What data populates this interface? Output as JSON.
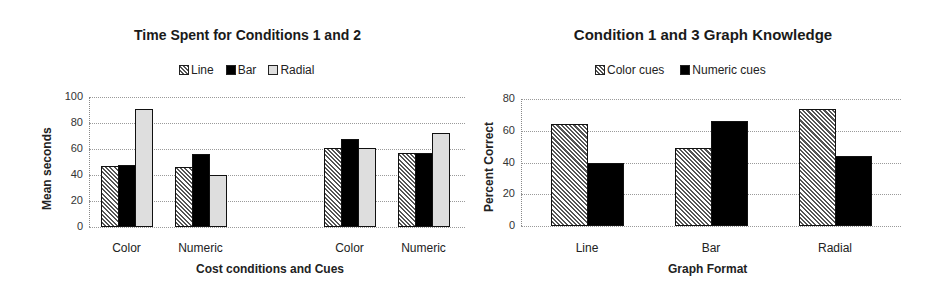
{
  "chart_data": [
    {
      "type": "bar",
      "title": "Time Spent for Conditions 1 and 2",
      "xlabel": "Cost conditions and Cues",
      "ylabel": "Mean seconds",
      "ylim": [
        0,
        100
      ],
      "yticks": [
        0,
        20,
        40,
        60,
        80,
        100
      ],
      "grid": true,
      "legend_position": "top",
      "categories": [
        "Color",
        "Numeric",
        "Color",
        "Numeric"
      ],
      "series": [
        {
          "name": "Line",
          "pattern": "hatch",
          "values": [
            47,
            46,
            61,
            57
          ]
        },
        {
          "name": "Bar",
          "pattern": "black",
          "values": [
            48,
            56,
            68,
            57
          ]
        },
        {
          "name": "Radial",
          "pattern": "light",
          "values": [
            91,
            40,
            61,
            72
          ]
        }
      ]
    },
    {
      "type": "bar",
      "title": "Condition 1 and 3 Graph Knowledge",
      "xlabel": "Graph Format",
      "ylabel": "Percent Correct",
      "ylim": [
        0,
        80
      ],
      "yticks": [
        0,
        20,
        40,
        60,
        80
      ],
      "grid": true,
      "legend_position": "top",
      "categories": [
        "Line",
        "Bar",
        "Radial"
      ],
      "series": [
        {
          "name": "Color cues",
          "pattern": "hatch",
          "values": [
            64,
            49,
            74
          ]
        },
        {
          "name": "Numeric cues",
          "pattern": "black",
          "values": [
            40,
            66,
            44
          ]
        }
      ]
    }
  ]
}
